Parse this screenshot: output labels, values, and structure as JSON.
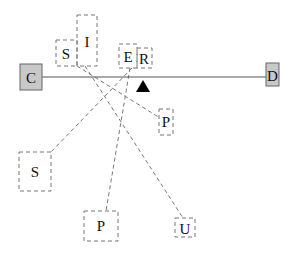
{
  "diagram": {
    "beam": {
      "x1": 42,
      "y1": 77,
      "x2": 266,
      "y2": 77,
      "color": "#555555"
    },
    "fulcrum": {
      "apex_x": 143,
      "apex_y": 80,
      "base_y": 92,
      "half_width": 7,
      "color": "#000000"
    },
    "anchors": [
      {
        "id": "C",
        "label": "C",
        "x": 20,
        "y": 64,
        "w": 22,
        "h": 26,
        "fill": "#c8c8c8",
        "stroke": "#666666"
      },
      {
        "id": "D",
        "label": "D",
        "x": 266,
        "y": 63,
        "w": 13,
        "h": 23,
        "fill": "#c8c8c8",
        "stroke": "#666666"
      }
    ],
    "boxes": [
      {
        "id": "S1",
        "label": "S",
        "x": 56,
        "y": 40,
        "w": 21,
        "h": 26,
        "tx": 66,
        "ty": 59
      },
      {
        "id": "I",
        "label": "I",
        "x": 77,
        "y": 15,
        "w": 20,
        "h": 51,
        "tx": 87,
        "ty": 47
      },
      {
        "id": "E",
        "label": "E",
        "x": 119,
        "y": 44,
        "w": 18,
        "h": 24,
        "tx": 128,
        "ty": 62
      },
      {
        "id": "R",
        "label": "R",
        "x": 137,
        "y": 48,
        "w": 15,
        "h": 20,
        "tx": 144,
        "ty": 64
      },
      {
        "id": "P1",
        "label": "P",
        "x": 159,
        "y": 109,
        "w": 14,
        "h": 26,
        "tx": 166,
        "ty": 127
      },
      {
        "id": "S2",
        "label": "S",
        "x": 19,
        "y": 152,
        "w": 32,
        "h": 39,
        "tx": 35,
        "ty": 177
      },
      {
        "id": "P2",
        "label": "P",
        "x": 84,
        "y": 211,
        "w": 34,
        "h": 30,
        "tx": 101,
        "ty": 231
      },
      {
        "id": "U",
        "label": "U",
        "x": 175,
        "y": 218,
        "w": 20,
        "h": 19,
        "tx": 185,
        "ty": 234
      }
    ],
    "connectors": [
      {
        "from": "S1/I",
        "to": "P1",
        "x1": 77,
        "y1": 66,
        "x2": 160,
        "y2": 118
      },
      {
        "from": "I",
        "to": "U",
        "x1": 85,
        "y1": 66,
        "x2": 183,
        "y2": 218
      },
      {
        "from": "E/R",
        "to": "S2",
        "x1": 132,
        "y1": 68,
        "x2": 51,
        "y2": 152
      },
      {
        "from": "E/R",
        "to": "P2",
        "x1": 130,
        "y1": 68,
        "x2": 106,
        "y2": 211
      }
    ],
    "dash_color": "#777777"
  }
}
